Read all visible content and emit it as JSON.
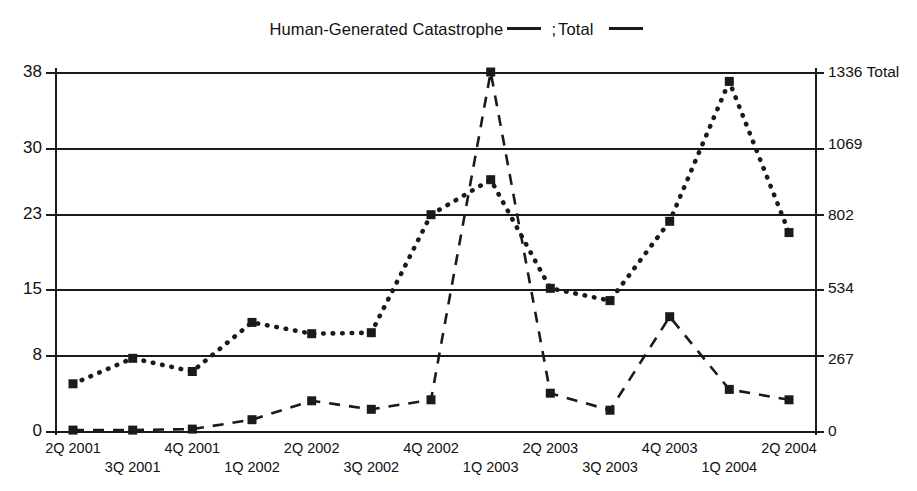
{
  "legend": {
    "series1_label": "Human-Generated Catastrophe",
    "separator": ";",
    "series2_label": "Total",
    "swatch1_name": "dashed-line-swatch",
    "swatch2_name": "dotted-line-swatch"
  },
  "chart_data": {
    "type": "line",
    "title": "",
    "subtitle": "",
    "xlabel": "",
    "ylabel": "",
    "ylabel_right": "Total",
    "grid": true,
    "legend_position": "top-center",
    "categories": [
      "2Q 2001",
      "3Q 2001",
      "4Q 2001",
      "1Q 2002",
      "2Q 2002",
      "3Q 2002",
      "4Q 2002",
      "1Q 2003",
      "2Q 2003",
      "3Q 2003",
      "4Q 2003",
      "1Q 2004",
      "2Q 2004"
    ],
    "ylim": [
      0,
      38
    ],
    "yticks": [
      0,
      8,
      15,
      23,
      30,
      38
    ],
    "ytick_labels": [
      "0",
      "8",
      "15",
      "23",
      "30",
      "38"
    ],
    "ylim_right": [
      0,
      1336
    ],
    "yticks_right": [
      0,
      267,
      534,
      802,
      1069,
      1336
    ],
    "ytick_labels_right": [
      "0",
      "267",
      "534",
      "802",
      "1069",
      "1336 Total"
    ],
    "series": [
      {
        "name": "Human-Generated Catastrophe",
        "style": "dashed",
        "marker": "square",
        "color": "#1a1a1a",
        "axis": "left",
        "values": [
          0.1,
          0.1,
          0.2,
          1.2,
          3.2,
          2.3,
          3.3,
          38.0,
          4.0,
          2.2,
          12.1,
          4.4,
          3.3
        ]
      },
      {
        "name": "Total",
        "style": "dotted",
        "marker": "square",
        "color": "#1a1a1a",
        "axis": "right",
        "values": [
          5.0,
          7.7,
          6.3,
          11.5,
          10.3,
          10.4,
          22.9,
          26.6,
          15.1,
          13.8,
          22.2,
          37.0,
          21.0
        ]
      }
    ]
  }
}
